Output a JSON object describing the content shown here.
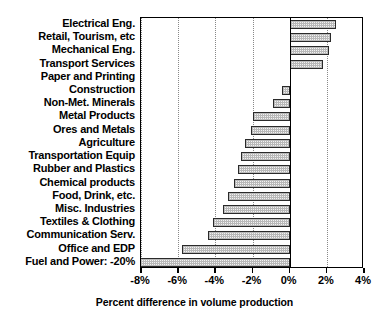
{
  "chart_data": {
    "type": "bar",
    "orientation": "horizontal",
    "title": "",
    "xlabel": "Percent difference in volume production",
    "ylabel": "",
    "xlim": [
      -8,
      4
    ],
    "xticks": [
      -8,
      -6,
      -4,
      -2,
      0,
      2,
      4
    ],
    "xtick_labels": [
      "-8%",
      "-6%",
      "-4%",
      "-2%",
      "0%",
      "2%",
      "4%"
    ],
    "grid": "vertical-dotted",
    "legend": "none",
    "categories": [
      "Electrical Eng.",
      "Retail, Tourism, etc",
      "Mechanical Eng.",
      "Transport Services",
      "Paper and Printing",
      "Construction",
      "Non-Met. Minerals",
      "Metal Products",
      "Ores and Metals",
      "Agriculture",
      "Transportation Equip",
      "Rubber and Plastics",
      "Chemical products",
      "Food, Drink, etc.",
      "Misc. Industries",
      "Textiles & Clothing",
      "Communication Serv.",
      "Office and EDP",
      "Fuel and Power: -20%"
    ],
    "values": [
      2.5,
      2.2,
      2.1,
      1.8,
      0.0,
      -0.4,
      -0.9,
      -2.0,
      -2.1,
      -2.4,
      -2.6,
      -2.8,
      -3.0,
      -3.3,
      -3.6,
      -4.1,
      -4.4,
      -5.8,
      -20.0
    ],
    "clipped_bars": [
      "Fuel and Power: -20%"
    ],
    "annotations": [
      "Fuel and Power bar extends beyond axis minimum; its true value -20% is noted in the category label."
    ]
  },
  "axis": {
    "xtitle": "Percent difference in volume production"
  }
}
